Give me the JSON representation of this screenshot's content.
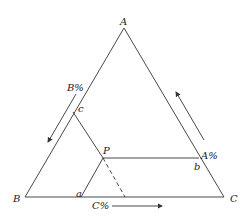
{
  "diagram": {
    "type": "ternary-phase-diagram",
    "vertices": {
      "A": "A",
      "B": "B",
      "C": "C"
    },
    "point": "P",
    "intersections": {
      "a": "a",
      "b": "b",
      "c": "c"
    },
    "axis_labels": {
      "left": "B%",
      "right": "A%",
      "bottom": "C%"
    },
    "colors": {
      "line": "#333333",
      "text": "#222222"
    }
  }
}
